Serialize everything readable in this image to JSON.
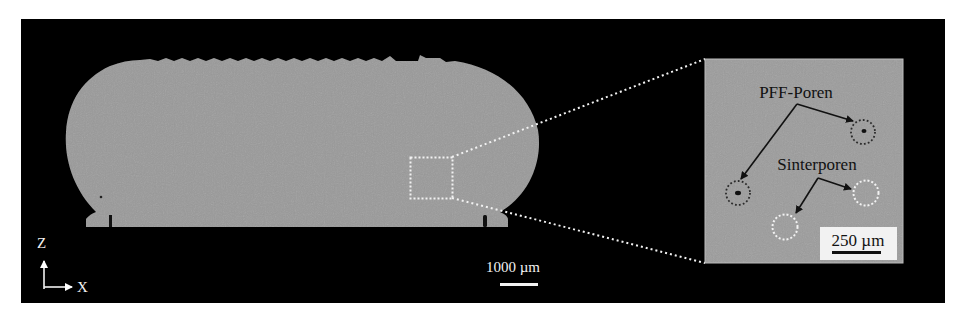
{
  "figure": {
    "type": "micrograph cross-section",
    "background_color": "#000000",
    "sample_color": "#9a9a9a",
    "axes": {
      "vertical_label": "Z",
      "horizontal_label": "X"
    },
    "main_scale_bar": {
      "label": "1000 µm"
    },
    "inset": {
      "annotations": {
        "pff_label": "PFF-Poren",
        "sinter_label": "Sinterporen"
      },
      "scale_bar": {
        "label": "250 µm"
      },
      "pff_circle_color": "#2a2a2a",
      "sinter_circle_color": "#f2f2f2"
    }
  }
}
